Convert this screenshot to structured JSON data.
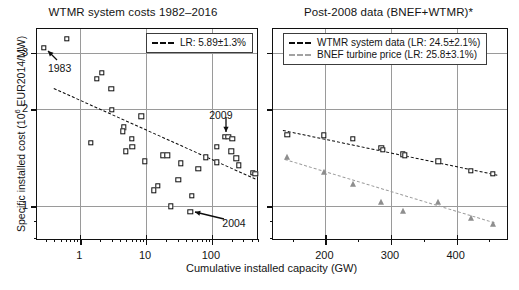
{
  "figure": {
    "width": 519,
    "height": 290,
    "background": "#ffffff",
    "shared_xlabel": "Cumulative installed capacity (GW)",
    "shared_ylabel_main": "Specific installed cost (10",
    "shared_ylabel_sup": "6",
    "shared_ylabel_tail": " EUR2014/MW)"
  },
  "chart_data": [
    {
      "type": "scatter",
      "panel": "left",
      "title": "WTMR system costs 1982–2016",
      "xlabel": "Cumulative installed capacity (GW)",
      "ylabel": "Specific installed cost (10^6 EUR2014/MW)",
      "xscale": "log",
      "yscale": "log",
      "xlim": [
        0.22,
        520
      ],
      "ylim": [
        0.78,
        3.55
      ],
      "xticks": [
        1,
        10,
        100
      ],
      "xticklabels": [
        "1",
        "10",
        "100"
      ],
      "yticks": [
        1,
        2,
        3
      ],
      "yticklabels": [
        "1",
        "2",
        "3"
      ],
      "grid": true,
      "legend_position": "upper right",
      "legend": [
        "LR: 5.89±1.3%"
      ],
      "series": [
        {
          "name": "WTMR system costs",
          "marker": "open-square",
          "color": "#0d0d0d",
          "points": [
            [
              0.28,
              3.1
            ],
            [
              0.62,
              3.31
            ],
            [
              1.8,
              2.49
            ],
            [
              2.15,
              2.6
            ],
            [
              2.95,
              2.31
            ],
            [
              3.0,
              1.99
            ],
            [
              4.6,
              1.76
            ],
            [
              4.4,
              1.71
            ],
            [
              1.45,
              1.57
            ],
            [
              6.0,
              1.62
            ],
            [
              8.5,
              1.9
            ],
            [
              4.9,
              1.48
            ],
            [
              6.2,
              1.53
            ],
            [
              9.5,
              1.38
            ],
            [
              15.0,
              1.16
            ],
            [
              18.0,
              1.44
            ],
            [
              21.0,
              1.44
            ],
            [
              13.0,
              1.12
            ],
            [
              34.0,
              1.36
            ],
            [
              31.0,
              1.21
            ],
            [
              24.0,
              1.0
            ],
            [
              49.0,
              1.08
            ],
            [
              62.0,
              1.31
            ],
            [
              47.0,
              0.96
            ],
            [
              80.0,
              1.42
            ],
            [
              120.0,
              1.53
            ],
            [
              118.0,
              1.37
            ],
            [
              159.0,
              1.64
            ],
            [
              178.0,
              1.64
            ],
            [
              205.0,
              1.62
            ],
            [
              198.0,
              1.48
            ],
            [
              235.0,
              1.41
            ],
            [
              258.0,
              1.34
            ],
            [
              420.0,
              1.27
            ],
            [
              455.0,
              1.26
            ]
          ]
        }
      ],
      "fits": [
        {
          "name": "LR: 5.89±1.3%",
          "style": "dashed",
          "color": "#0a0a0a",
          "endpoints": [
            [
              0.4,
              2.33
            ],
            [
              460.0,
              1.22
            ]
          ]
        }
      ],
      "annotations": [
        {
          "text": "1983",
          "target_point": [
            0.28,
            3.1
          ]
        },
        {
          "text": "2009",
          "target_point": [
            159.0,
            1.64
          ]
        },
        {
          "text": "2004",
          "target_point": [
            47.0,
            0.96
          ]
        }
      ]
    },
    {
      "type": "scatter",
      "panel": "right",
      "title": "Post-2008 data (BNEF+WTMR)*",
      "xlabel": "Cumulative installed capacity (GW)",
      "ylabel": "Specific installed cost (10^6 EUR2014/MW)",
      "xscale": "linear",
      "yscale": "log",
      "xlim": [
        120,
        480
      ],
      "ylim": [
        0.78,
        3.55
      ],
      "xticks": [
        200,
        300,
        400
      ],
      "xticklabels": [
        "200",
        "300",
        "400"
      ],
      "yticks": [
        1,
        2,
        3
      ],
      "yticklabels": [
        "",
        "",
        ""
      ],
      "grid": true,
      "legend_position": "upper left",
      "legend": [
        "WTMR system data (LR: 24.5±2.1%)",
        "BNEF turbine price (LR: 25.8±3.1%)"
      ],
      "series": [
        {
          "name": "WTMR system data",
          "marker": "open-square",
          "color": "#0d0d0d",
          "points": [
            [
              142,
              1.67
            ],
            [
              197,
              1.66
            ],
            [
              242,
              1.62
            ],
            [
              285,
              1.52
            ],
            [
              288,
              1.5
            ],
            [
              318,
              1.45
            ],
            [
              321,
              1.44
            ],
            [
              372,
              1.38
            ],
            [
              422,
              1.29
            ],
            [
              455,
              1.26
            ]
          ]
        },
        {
          "name": "BNEF turbine price",
          "marker": "filled-triangle",
          "color": "#8e8e8e",
          "points": [
            [
              142,
              1.42
            ],
            [
              197,
              1.28
            ],
            [
              242,
              1.17
            ],
            [
              285,
              1.03
            ],
            [
              318,
              0.97
            ],
            [
              372,
              1.03
            ],
            [
              422,
              0.92
            ],
            [
              455,
              0.88
            ]
          ]
        }
      ],
      "fits": [
        {
          "name": "WTMR system data (LR: 24.5±2.1%)",
          "style": "dashed",
          "color": "#0a0a0a",
          "endpoints": [
            [
              135,
              1.72
            ],
            [
              462,
              1.25
            ]
          ]
        },
        {
          "name": "BNEF turbine price (LR: 25.8±3.1%)",
          "style": "dashed",
          "color": "#9d9d9d",
          "endpoints": [
            [
              138,
              1.4
            ],
            [
              458,
              0.89
            ]
          ]
        }
      ],
      "annotations": []
    }
  ],
  "left_panel": {
    "title": "WTMR system costs 1982–2016",
    "legend": {
      "entry_1": "LR: 5.89±1.3%"
    },
    "xtick_labels": [
      "1",
      "10",
      "100"
    ],
    "ytick_labels": [
      "3",
      "2",
      "1"
    ],
    "annotations": {
      "a1": "1983",
      "a2": "2009",
      "a3": "2004"
    }
  },
  "right_panel": {
    "title": "Post-2008 data (BNEF+WTMR)*",
    "legend": {
      "entry_1": "WTMR system data (LR: 24.5±2.1%)",
      "entry_2": "BNEF turbine price (LR: 25.8±3.1%)"
    },
    "xtick_labels": [
      "200",
      "300",
      "400"
    ]
  },
  "colors": {
    "axis": "#101010",
    "grid": "#9a9a9a",
    "marker_dark": "#0d0d0d",
    "marker_light": "#8e8e8e",
    "fit_dark": "#0a0a0a",
    "fit_light": "#9d9d9d",
    "background": "#ffffff"
  }
}
